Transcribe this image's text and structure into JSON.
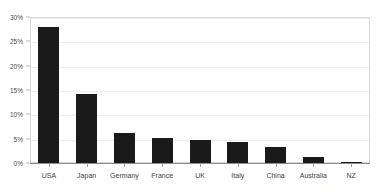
{
  "chart_data": {
    "type": "bar",
    "title": "",
    "xlabel": "",
    "ylabel": "",
    "categories": [
      "USA",
      "Japan",
      "Germany",
      "France",
      "UK",
      "Italy",
      "China",
      "Australia",
      "NZ"
    ],
    "values": [
      28.0,
      14.2,
      6.2,
      5.2,
      4.7,
      4.3,
      3.3,
      1.2,
      0.3
    ],
    "ylim": [
      0,
      30
    ],
    "ytick_values": [
      0,
      5,
      10,
      15,
      20,
      25,
      30
    ],
    "ytick_labels": [
      "0%",
      "5%",
      "10%",
      "15%",
      "20%",
      "25%",
      "30%"
    ],
    "grid": true,
    "legend": false,
    "bar_color": "#1a1a1a",
    "plot_border_color": "#d6d6d6",
    "axis_color": "#8c8c8c",
    "background_color": "#ffffff"
  }
}
